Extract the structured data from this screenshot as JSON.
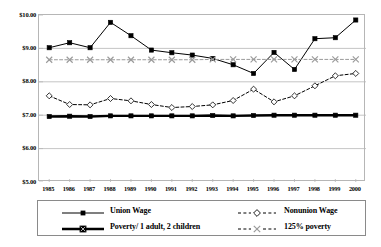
{
  "chart_data": {
    "type": "line",
    "title": "",
    "xlabel": "",
    "ylabel": "",
    "x": [
      1985,
      1986,
      1987,
      1988,
      1989,
      1990,
      1991,
      1992,
      1993,
      1994,
      1995,
      1996,
      1997,
      1998,
      1999,
      2000
    ],
    "categories": [
      "1985",
      "1986",
      "1987",
      "1988",
      "1989",
      "1990",
      "1991",
      "1992",
      "1993",
      "1994",
      "1995",
      "1996",
      "1997",
      "1998",
      "1999",
      "2000"
    ],
    "ylim": [
      5.0,
      10.0
    ],
    "ytick_values": [
      5.0,
      6.0,
      7.0,
      8.0,
      9.0,
      10.0
    ],
    "ytick_labels": [
      "$5.00",
      "$6.00",
      "$7.00",
      "$8.00",
      "$9.00",
      "$10.00"
    ],
    "grid": true,
    "legend_position": "bottom",
    "series": [
      {
        "name": "Union Wage",
        "marker": "filled-square",
        "line_style": "solid",
        "line_width": "thin",
        "color": "#000000",
        "values": [
          9.02,
          9.17,
          9.02,
          9.78,
          9.38,
          8.95,
          8.87,
          8.8,
          8.7,
          8.51,
          8.25,
          8.88,
          8.37,
          9.29,
          9.32,
          9.85
        ]
      },
      {
        "name": "Nonunion Wage",
        "marker": "open-diamond",
        "line_style": "dashed",
        "line_width": "thin",
        "color": "#000000",
        "values": [
          7.58,
          7.32,
          7.31,
          7.5,
          7.43,
          7.32,
          7.23,
          7.26,
          7.31,
          7.44,
          7.78,
          7.4,
          7.58,
          7.88,
          8.18,
          8.25
        ]
      },
      {
        "name": "Poverty/ 1 adult, 2 children",
        "marker": "filled-square",
        "line_style": "solid",
        "line_width": "thick",
        "color": "#000000",
        "values": [
          6.96,
          6.97,
          6.96,
          6.98,
          6.98,
          6.98,
          6.98,
          6.98,
          6.99,
          6.98,
          6.99,
          7.0,
          7.0,
          7.0,
          7.0,
          7.0
        ]
      },
      {
        "name": "125% poverty",
        "marker": "x-cross",
        "line_style": "dashed",
        "line_width": "thin",
        "color": "#9a9a9a",
        "values": [
          8.66,
          8.66,
          8.66,
          8.66,
          8.66,
          8.66,
          8.66,
          8.66,
          8.67,
          8.67,
          8.67,
          8.67,
          8.67,
          8.67,
          8.67,
          8.67
        ]
      }
    ]
  },
  "legend": {
    "entries": [
      {
        "label": "Union Wage",
        "key": "solid-thin-square"
      },
      {
        "label": "Nonunion Wage",
        "key": "dashed-open-diamond"
      },
      {
        "label": "Poverty/ 1 adult, 2 children",
        "key": "solid-thick-square"
      },
      {
        "label": "125% poverty",
        "key": "dashed-x-cross"
      }
    ]
  },
  "colors": {
    "axis": "#b6b6b6",
    "grid": "#b6b6b6",
    "series_dark": "#000000",
    "series_gray": "#9a9a9a",
    "legend_border": "#8a8a8a",
    "background": "#ffffff"
  }
}
